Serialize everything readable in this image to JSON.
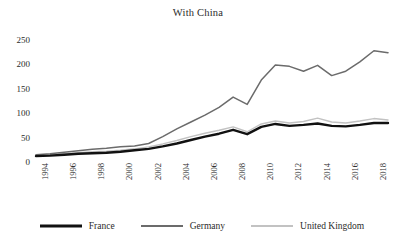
{
  "chart_data": {
    "type": "line",
    "title": "With China",
    "xlabel": "",
    "ylabel": "",
    "grid": false,
    "legend_position": "bottom",
    "x": [
      1994,
      1995,
      1996,
      1997,
      1998,
      1999,
      2000,
      2001,
      2002,
      2003,
      2004,
      2005,
      2006,
      2007,
      2008,
      2009,
      2010,
      2011,
      2012,
      2013,
      2014,
      2015,
      2016,
      2017,
      2018,
      2019
    ],
    "xlim": [
      1994,
      2019
    ],
    "ylim": [
      0,
      250
    ],
    "yticks": [
      0,
      50,
      100,
      150,
      200,
      250
    ],
    "xticks": [
      1994,
      1996,
      1998,
      2000,
      2002,
      2004,
      2006,
      2008,
      2010,
      2012,
      2014,
      2016,
      2018
    ],
    "xtick_labels": [
      "1994",
      "1996",
      "1998",
      "2000",
      "2002",
      "2004",
      "2006",
      "2008",
      "2010",
      "2012",
      "2014",
      "2016",
      "2018"
    ],
    "ytick_labels": [
      "0",
      "50",
      "100",
      "150",
      "200",
      "250"
    ],
    "series": [
      {
        "name": "France",
        "color": "#111111",
        "width": 2.4,
        "values": [
          12,
          13,
          15,
          17,
          18,
          19,
          21,
          24,
          27,
          32,
          38,
          45,
          52,
          58,
          66,
          57,
          72,
          78,
          74,
          76,
          79,
          74,
          73,
          76,
          80,
          80
        ]
      },
      {
        "name": "Germany",
        "color": "#6b6b6b",
        "width": 1.5,
        "values": [
          15,
          17,
          20,
          23,
          26,
          28,
          31,
          33,
          38,
          52,
          68,
          82,
          96,
          112,
          133,
          118,
          168,
          199,
          196,
          186,
          198,
          177,
          186,
          205,
          228,
          224
        ]
      },
      {
        "name": "United Kingdom",
        "color": "#c2c2c2",
        "width": 1.4,
        "values": [
          14,
          15,
          17,
          19,
          21,
          22,
          24,
          27,
          31,
          37,
          44,
          52,
          59,
          65,
          72,
          62,
          78,
          84,
          80,
          83,
          90,
          82,
          80,
          84,
          89,
          86
        ]
      }
    ]
  },
  "legend": {
    "items": [
      {
        "label": "France"
      },
      {
        "label": "Germany"
      },
      {
        "label": "United Kingdom"
      }
    ]
  }
}
